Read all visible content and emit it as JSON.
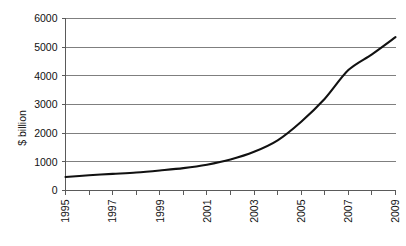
{
  "chart_data": {
    "type": "line",
    "title": "",
    "subtitle": "",
    "xlabel": "",
    "ylabel": "$ billion",
    "xlim": [
      1995,
      2009
    ],
    "ylim": [
      0,
      6000
    ],
    "grid": true,
    "legend": false,
    "legend_position": "none",
    "yticks": [
      0,
      1000,
      2000,
      3000,
      4000,
      5000,
      6000
    ],
    "ytick_labels": [
      "0",
      "1000",
      "2000",
      "3000",
      "4000",
      "5000",
      "6000"
    ],
    "xticks": [
      1995,
      1996,
      1997,
      1998,
      1999,
      2000,
      2001,
      2002,
      2003,
      2004,
      2005,
      2006,
      2007,
      2008,
      2009
    ],
    "xtick_labels": [
      "1995",
      "",
      "1997",
      "",
      "1999",
      "",
      "2001",
      "",
      "2003",
      "",
      "2005",
      "",
      "2007",
      "",
      "2009"
    ],
    "xtick_labels_shown": [
      "1995",
      "1997",
      "1999",
      "2001",
      "2003",
      "2005",
      "2007",
      "2009"
    ],
    "xtick_label_rotation": 90,
    "x": [
      1995,
      1996,
      1997,
      1998,
      1999,
      2000,
      2001,
      2002,
      2003,
      2004,
      2005,
      2006,
      2007,
      2008,
      2009
    ],
    "values": [
      470,
      530,
      580,
      630,
      700,
      780,
      900,
      1080,
      1350,
      1750,
      2400,
      3200,
      4200,
      4750,
      5350
    ],
    "series": [
      {
        "name": "",
        "color": "#111111",
        "values": [
          470,
          530,
          580,
          630,
          700,
          780,
          900,
          1080,
          1350,
          1750,
          2400,
          3200,
          4200,
          4750,
          5350
        ]
      }
    ],
    "annotations": []
  },
  "style": {
    "background": "#ffffff",
    "grid_color": "#7f7f7f",
    "axis_color": "#5a5a5a",
    "line_color": "#111111"
  }
}
